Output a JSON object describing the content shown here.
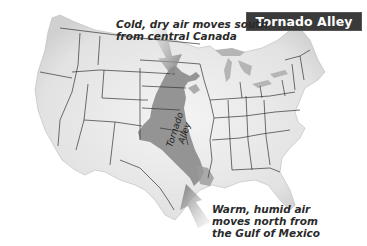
{
  "title": "Tornado Alley",
  "map_region": "Continental United States",
  "region_label": {
    "line1": "Tornado",
    "line2": "Alley"
  },
  "annotations": {
    "cold_air": {
      "line1": "Cold, dry air moves south",
      "line2": "from central Canada"
    },
    "warm_air": {
      "line1": "Warm, humid air",
      "line2": "moves north from",
      "line3": "the Gulf of Mexico"
    }
  },
  "colors": {
    "title_bg": "#3a3a3a",
    "title_text": "#ffffff",
    "tornado_alley_fill": "#8c8c8c",
    "arrow_fill": "#8a8a8a",
    "land": "#f1f1f1",
    "state_borders": "#333333",
    "water": "#b5b5b5"
  }
}
